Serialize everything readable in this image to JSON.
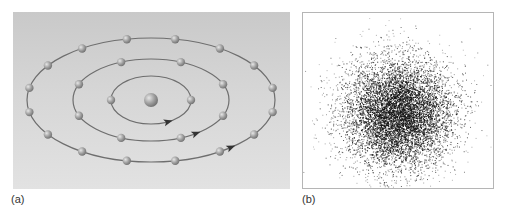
{
  "figure": {
    "panel_a": {
      "label": "(a)",
      "description": "Bohr model: nucleus with electrons on three concentric elliptical orbits",
      "nucleus": {
        "cx": 138,
        "cy": 88,
        "r": 7
      },
      "orbits": [
        {
          "name": "inner",
          "rx": 40,
          "ry": 24,
          "electrons": 2,
          "arrow_angle_deg": 65
        },
        {
          "name": "middle",
          "rx": 78,
          "ry": 41,
          "electrons": 8,
          "arrow_angle_deg": 55
        },
        {
          "name": "outer",
          "rx": 124,
          "ry": 62,
          "electrons": 16,
          "arrow_angle_deg": 50
        }
      ],
      "colors": {
        "orbit": "#6e6e6e",
        "electron": "#9a9a9a",
        "background": "#d4d4d4"
      }
    },
    "panel_b": {
      "label": "(b)",
      "description": "Electron probability cloud (dot density plot)",
      "cloud": {
        "cx": 95,
        "cy": 100,
        "sigma_x": 28,
        "sigma_y": 28,
        "points": 9000
      }
    }
  }
}
